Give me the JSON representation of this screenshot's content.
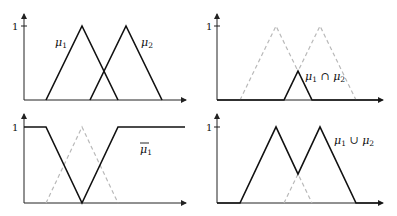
{
  "figure": {
    "panels": [
      {
        "id": "sets",
        "position": "top-left",
        "y_tick_label": "1",
        "labels": [
          {
            "text": "μ",
            "sub": "1",
            "overline": false
          },
          {
            "text": "μ",
            "sub": "2",
            "overline": false
          }
        ]
      },
      {
        "id": "intersection",
        "position": "top-right",
        "y_tick_label": "1",
        "labels": [
          {
            "text": "μ",
            "sub": "1",
            "op": " ∩ ",
            "text2": "μ",
            "sub2": "2"
          }
        ]
      },
      {
        "id": "complement",
        "position": "bottom-left",
        "y_tick_label": "1",
        "labels": [
          {
            "text": "μ",
            "sub": "1",
            "overline": true
          }
        ]
      },
      {
        "id": "union",
        "position": "bottom-right",
        "y_tick_label": "1",
        "labels": [
          {
            "text": "μ",
            "sub": "1",
            "op": " ∪ ",
            "text2": "μ",
            "sub2": "2"
          }
        ]
      }
    ],
    "colors": {
      "solid_line": "#111111",
      "dashed_line": "#b9b9b9",
      "axis": "#222222"
    }
  }
}
